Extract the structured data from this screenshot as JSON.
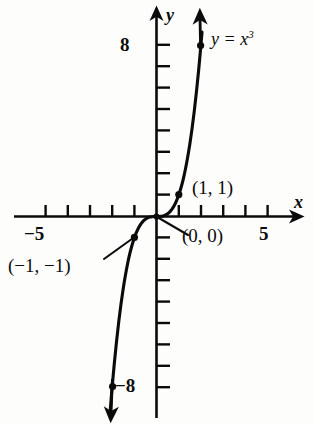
{
  "figure": {
    "background_color": "#fdfdfc",
    "ink_color": "#0b0b0b"
  },
  "axes": {
    "x_axis_label": "x",
    "y_axis_label": "y",
    "x_tick_labels": [
      "−5",
      "5"
    ],
    "y_tick_labels": [
      "8",
      "−8"
    ],
    "x_label_left": "−5",
    "x_label_right": "5",
    "y_label_top": "8",
    "y_label_bottom": "−8"
  },
  "annotations": {
    "curve_label_base": "y = x",
    "curve_label_exponent": "3",
    "point_1_1": "(1, 1)",
    "point_0_0": "(0, 0)",
    "point_neg1_neg1": "(−1, −1)"
  },
  "chart_data": {
    "type": "line",
    "xlabel": "x",
    "ylabel": "y",
    "xlim": [
      -5.8,
      5.8
    ],
    "ylim": [
      -9.5,
      9.5
    ],
    "grid": false,
    "legend": "none",
    "x_ticks": [
      -5,
      -4,
      -3,
      -2,
      -1,
      1,
      2,
      3,
      4,
      5
    ],
    "y_ticks": [
      -8,
      -7,
      -6,
      -5,
      -4,
      -3,
      -2,
      -1,
      1,
      2,
      3,
      4,
      5,
      6,
      7,
      8
    ],
    "x_tick_labeled": [
      -5,
      5
    ],
    "y_tick_labeled": [
      -8,
      8
    ],
    "series": [
      {
        "name": "y = x^3",
        "equation": "y = x^3",
        "x": [
          -2.08,
          -2.0,
          -1.9,
          -1.8,
          -1.7,
          -1.6,
          -1.5,
          -1.4,
          -1.3,
          -1.2,
          -1.1,
          -1.0,
          -0.9,
          -0.8,
          -0.7,
          -0.6,
          -0.5,
          -0.4,
          -0.3,
          -0.2,
          -0.1,
          0.0,
          0.1,
          0.2,
          0.3,
          0.4,
          0.5,
          0.6,
          0.7,
          0.8,
          0.9,
          1.0,
          1.1,
          1.2,
          1.3,
          1.4,
          1.5,
          1.6,
          1.7,
          1.8,
          1.9,
          2.0,
          2.05
        ],
        "y": [
          -9.0,
          -8.0,
          -6.859,
          -5.832,
          -4.913,
          -4.096,
          -3.375,
          -2.744,
          -2.197,
          -1.728,
          -1.331,
          -1.0,
          -0.729,
          -0.512,
          -0.343,
          -0.216,
          -0.125,
          -0.064,
          -0.027,
          -0.008,
          -0.001,
          0.0,
          0.001,
          0.008,
          0.027,
          0.064,
          0.125,
          0.216,
          0.343,
          0.512,
          0.729,
          1.0,
          1.331,
          1.728,
          2.197,
          2.744,
          3.375,
          4.096,
          4.913,
          5.832,
          6.859,
          8.0,
          8.615
        ],
        "arrow_start": true,
        "arrow_end": true
      }
    ],
    "points": [
      {
        "label": "(1, 1)",
        "x": 1,
        "y": 1,
        "marker": "dot"
      },
      {
        "label": "(0, 0)",
        "x": 0,
        "y": 0,
        "marker": "dot"
      },
      {
        "label": "(−1, −1)",
        "x": -1,
        "y": -1,
        "marker": "dot"
      },
      {
        "label": "",
        "x": 2.0,
        "y": 8.0,
        "marker": "dot"
      },
      {
        "label": "",
        "x": -2.0,
        "y": -8.0,
        "marker": "dot"
      }
    ]
  }
}
